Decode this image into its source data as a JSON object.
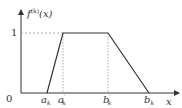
{
  "diagram": {
    "type": "trapezoidal membership function",
    "y_label": {
      "base": "f",
      "sup": "(k)",
      "arg": "(x)"
    },
    "x_label": "x",
    "origin_label": "0",
    "y_tick_label": "1",
    "points": [
      {
        "name": "a_k",
        "base": "a",
        "sub": "k",
        "prime": "",
        "x_frac": 0.2,
        "y": 0
      },
      {
        "name": "a'_k",
        "base": "a",
        "sub": "k",
        "prime": "′",
        "x_frac": 0.33,
        "y": 1
      },
      {
        "name": "b'_k",
        "base": "b",
        "sub": "k",
        "prime": "′",
        "x_frac": 0.68,
        "y": 1
      },
      {
        "name": "b_k",
        "base": "b",
        "sub": "k",
        "prime": "",
        "x_frac": 1.0,
        "y": 0
      }
    ],
    "colors": {
      "line": "#333333",
      "dashed": "#999999"
    }
  }
}
